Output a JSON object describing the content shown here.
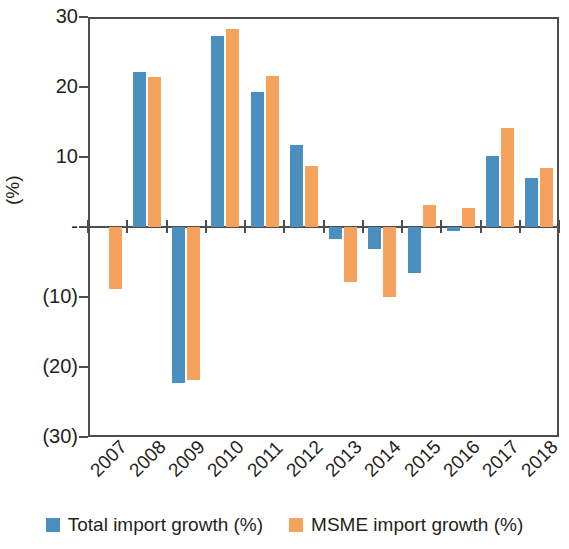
{
  "chart_data": {
    "type": "bar",
    "title": "",
    "subtitle": "",
    "xlabel": "",
    "ylabel": "(%)",
    "ylim": [
      -30,
      30
    ],
    "yticks": [
      30,
      20,
      10,
      0,
      -10,
      -20,
      -30
    ],
    "ytick_labels": [
      "30",
      "20",
      "10",
      "-",
      "(10)",
      "(20)",
      "(30)"
    ],
    "grid": false,
    "legend_position": "bottom",
    "categories": [
      "2007",
      "2008",
      "2009",
      "2010",
      "2011",
      "2012",
      "2013",
      "2014",
      "2015",
      "2016",
      "2017",
      "2018"
    ],
    "series": [
      {
        "name": "Total import growth (%)",
        "color": "#4b8fc0",
        "values": [
          null,
          22.2,
          -22.3,
          27.3,
          19.3,
          11.7,
          -1.7,
          -3.1,
          -6.6,
          -0.5,
          10.1,
          7.0
        ]
      },
      {
        "name": "MSME import growth (%)",
        "color": "#f5a35c",
        "values": [
          -8.8,
          21.5,
          -21.8,
          28.3,
          21.6,
          8.7,
          -7.8,
          -10.0,
          3.2,
          2.7,
          14.1,
          8.5
        ]
      }
    ]
  },
  "legend": {
    "items": [
      {
        "label": "Total import growth (%)",
        "color": "#4b8fc0"
      },
      {
        "label": "MSME import growth (%)",
        "color": "#f5a35c"
      }
    ]
  },
  "axis": {
    "y_title": "(%)"
  }
}
